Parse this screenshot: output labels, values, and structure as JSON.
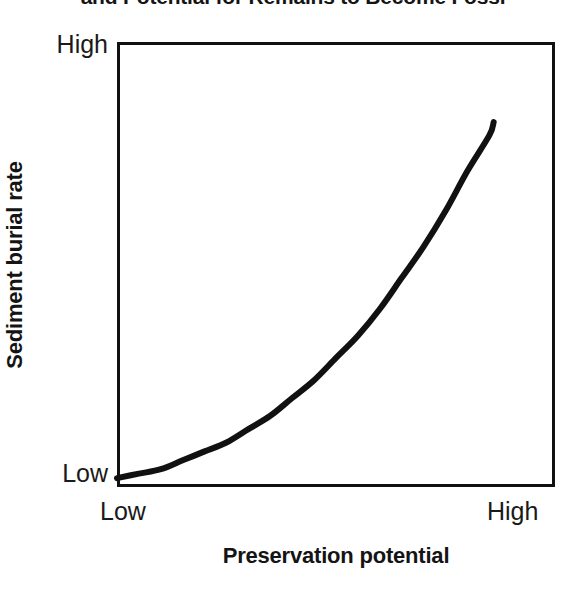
{
  "chart_data": {
    "type": "line",
    "title": "and Potential for Remains to Become Fossi",
    "title_clipped": true,
    "xlabel": "Preservation potential",
    "ylabel": "Sediment burial rate",
    "x_tick_labels": [
      "Low",
      "High"
    ],
    "y_tick_labels": [
      "Low",
      "High"
    ],
    "xlim": [
      0,
      1
    ],
    "ylim": [
      0,
      1
    ],
    "grid": false,
    "legend": null,
    "annotations": [],
    "series": [
      {
        "name": "Sediment burial rate vs preservation potential",
        "color": "#111111",
        "line_width": 6,
        "x": [
          0.0,
          0.05,
          0.1,
          0.15,
          0.2,
          0.25,
          0.3,
          0.35,
          0.4,
          0.45,
          0.5,
          0.55,
          0.6,
          0.65,
          0.7,
          0.75,
          0.8,
          0.85,
          0.86
        ],
        "y": [
          0.02,
          0.03,
          0.04,
          0.06,
          0.08,
          0.1,
          0.13,
          0.16,
          0.2,
          0.24,
          0.29,
          0.34,
          0.4,
          0.47,
          0.54,
          0.62,
          0.71,
          0.79,
          0.82
        ]
      }
    ]
  },
  "axes": {
    "y": {
      "title": "Sediment burial rate",
      "tick_high": "High",
      "tick_low": "Low"
    },
    "x": {
      "title": "Preservation potential",
      "tick_low": "Low",
      "tick_high": "High"
    }
  },
  "colors": {
    "curve": "#111111",
    "frame": "#111111",
    "text": "#1a1a1a",
    "title_text": "#141414",
    "background": "#ffffff"
  }
}
